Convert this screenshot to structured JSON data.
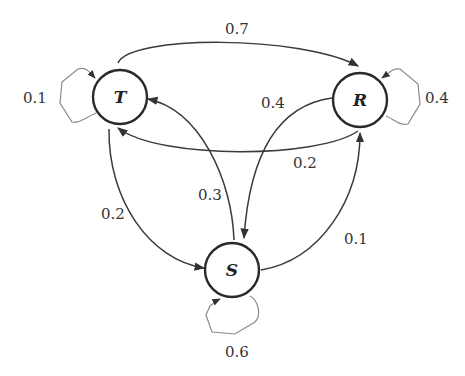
{
  "diagram": {
    "type": "markov-chain-state-diagram",
    "nodes": [
      {
        "id": "T",
        "label": "T"
      },
      {
        "id": "R",
        "label": "R"
      },
      {
        "id": "S",
        "label": "S"
      }
    ],
    "edges": [
      {
        "from": "T",
        "to": "R",
        "label": "0.7"
      },
      {
        "from": "T",
        "to": "T",
        "label": "0.1"
      },
      {
        "from": "T",
        "to": "S",
        "label": "0.2"
      },
      {
        "from": "R",
        "to": "R",
        "label": "0.4"
      },
      {
        "from": "R",
        "to": "S",
        "label": "0.4"
      },
      {
        "from": "R",
        "to": "T",
        "label": "0.2"
      },
      {
        "from": "S",
        "to": "T",
        "label": "0.3"
      },
      {
        "from": "S",
        "to": "R",
        "label": "0.1"
      },
      {
        "from": "S",
        "to": "S",
        "label": "0.6"
      }
    ]
  }
}
